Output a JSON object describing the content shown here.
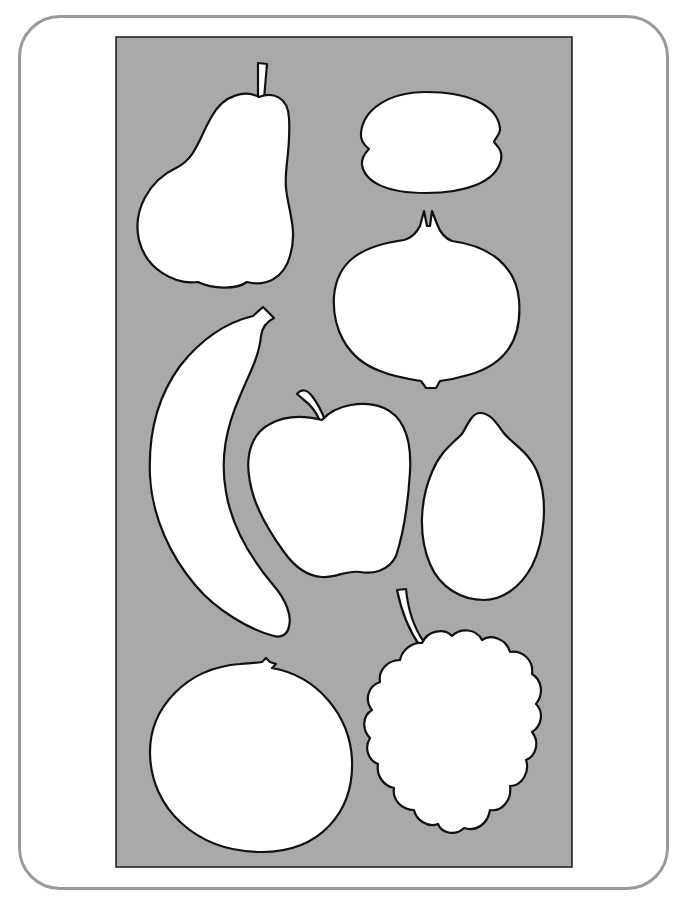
{
  "figure": {
    "title": "",
    "frame": {
      "border_color": "#9a9a9a",
      "background": "#ffffff"
    },
    "panel": {
      "fill": "#a9a9a9",
      "border": "#1a1a1a"
    },
    "fruits": [
      {
        "id": "pear",
        "label": "pear",
        "fill": "#ffffff",
        "outline": "#111111"
      },
      {
        "id": "lemon-flat",
        "label": "flattened fruit",
        "fill": "#ffffff",
        "outline": "#111111"
      },
      {
        "id": "pomegranate",
        "label": "pomegranate",
        "fill": "#ffffff",
        "outline": "#111111"
      },
      {
        "id": "banana",
        "label": "banana",
        "fill": "#ffffff",
        "outline": "#111111"
      },
      {
        "id": "apple",
        "label": "apple",
        "fill": "#ffffff",
        "outline": "#111111"
      },
      {
        "id": "lemon",
        "label": "lemon",
        "fill": "#ffffff",
        "outline": "#111111"
      },
      {
        "id": "orange",
        "label": "orange",
        "fill": "#ffffff",
        "outline": "#111111"
      },
      {
        "id": "grapes",
        "label": "grapes",
        "fill": "#ffffff",
        "outline": "#111111"
      }
    ]
  }
}
